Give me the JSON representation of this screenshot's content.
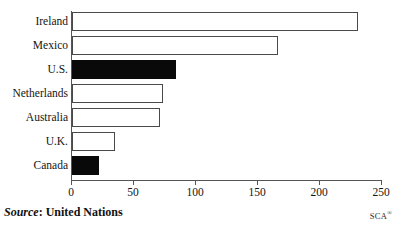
{
  "chart_data": {
    "type": "bar",
    "orientation": "horizontal",
    "title": "",
    "xlabel": "",
    "ylabel": "",
    "categories": [
      "Ireland",
      "Mexico",
      "U.S.",
      "Netherlands",
      "Australia",
      "U.K.",
      "Canada"
    ],
    "values": [
      231,
      166,
      84,
      73,
      71,
      35,
      22
    ],
    "highlighted": [
      false,
      false,
      true,
      false,
      false,
      false,
      true
    ],
    "xlim": [
      0,
      250
    ],
    "xticks": [
      0,
      50,
      100,
      150,
      200,
      250
    ],
    "xtick_labels": [
      "0",
      "50",
      "100",
      "150",
      "200",
      "250"
    ],
    "grid": false,
    "legend": "none",
    "bar_fill_default": "#ffffff",
    "bar_fill_highlight": "#090909",
    "bar_edge_color": "#4a4a4a",
    "axis_color": "#555555"
  },
  "footer": {
    "source_word": "Source",
    "source_separator": ":",
    "source_value": "United Nations",
    "credit": "SCA",
    "credit_mark": "®"
  }
}
